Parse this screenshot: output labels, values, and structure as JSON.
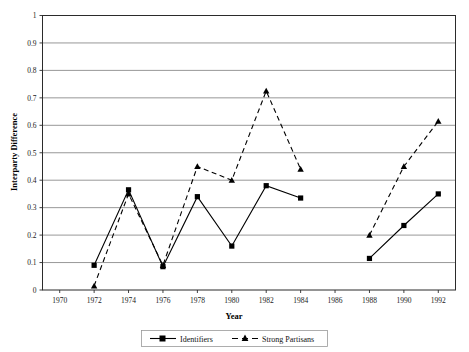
{
  "chart_data": {
    "type": "line",
    "title": "",
    "xlabel": "Year",
    "ylabel": "Interparty Difference",
    "x": [
      1970,
      1972,
      1974,
      1976,
      1978,
      1980,
      1982,
      1984,
      1986,
      1988,
      1990,
      1992
    ],
    "xlim": [
      1969,
      1993
    ],
    "ylim": [
      0,
      1
    ],
    "xticks": [
      "1970",
      "1972",
      "1974",
      "1976",
      "1978",
      "1980",
      "1982",
      "1984",
      "1986",
      "1988",
      "1990",
      "1992"
    ],
    "yticks": [
      "0",
      "0.1",
      "0.2",
      "0.3",
      "0.4",
      "0.5",
      "0.6",
      "0.7",
      "0.8",
      "0.9",
      "1"
    ],
    "grid": "horizontal",
    "legend_position": "bottom-center",
    "series": [
      {
        "name": "Identifiers",
        "marker": "square",
        "linestyle": "solid",
        "color": "#000000",
        "points": [
          {
            "x": 1972,
            "y": 0.09
          },
          {
            "x": 1974,
            "y": 0.365
          },
          {
            "x": 1976,
            "y": 0.085
          },
          {
            "x": 1978,
            "y": 0.34
          },
          {
            "x": 1980,
            "y": 0.16
          },
          {
            "x": 1982,
            "y": 0.38
          },
          {
            "x": 1984,
            "y": 0.335
          }
        ],
        "points_segment2": [
          {
            "x": 1988,
            "y": 0.115
          },
          {
            "x": 1990,
            "y": 0.235
          },
          {
            "x": 1992,
            "y": 0.35
          }
        ]
      },
      {
        "name": "Strong Partisans",
        "marker": "triangle",
        "linestyle": "dashed",
        "color": "#000000",
        "points": [
          {
            "x": 1972,
            "y": 0.015
          },
          {
            "x": 1974,
            "y": 0.35
          },
          {
            "x": 1976,
            "y": 0.09
          },
          {
            "x": 1978,
            "y": 0.45
          },
          {
            "x": 1980,
            "y": 0.4
          },
          {
            "x": 1982,
            "y": 0.725
          },
          {
            "x": 1984,
            "y": 0.44
          }
        ],
        "points_segment2": [
          {
            "x": 1988,
            "y": 0.2
          },
          {
            "x": 1990,
            "y": 0.45
          },
          {
            "x": 1992,
            "y": 0.615
          }
        ]
      }
    ]
  },
  "legend": {
    "items": [
      {
        "label": "Identifiers",
        "marker": "square",
        "linestyle": "solid"
      },
      {
        "label": "Strong Partisans",
        "marker": "triangle",
        "linestyle": "dashed"
      }
    ]
  },
  "axes": {
    "x_title": "Year",
    "y_title": "Interparty Difference"
  },
  "colors": {
    "plot_border": "#2b2b2b",
    "gridline": "#8c8c8c",
    "series_line": "#000000",
    "background": "#ffffff"
  }
}
